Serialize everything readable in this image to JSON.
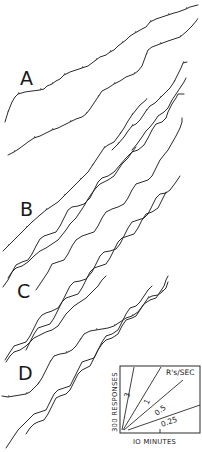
{
  "figure": {
    "panels": [
      {
        "label": "A",
        "x": 20,
        "y": 85
      },
      {
        "label": "B",
        "x": 20,
        "y": 216
      },
      {
        "label": "C",
        "x": 17,
        "y": 298
      },
      {
        "label": "D",
        "x": 18,
        "y": 380
      }
    ],
    "records": [
      {
        "name": "record-A1",
        "points": "5,122 8,112 12,102 15,97 18,94 25,92 32,91 40,90 44,89 47,86 52,84 56,81 60,79 64,75 70,72 76,70 82,68 88,66 92,63 96,60 100,57 106,55 110,52 114,50 118,46 122,43 126,40 130,36 135,33 142,29 146,27 150,22 156,19 162,17 168,15 174,13 178,12 186,9 190,7 198,5"
      },
      {
        "name": "record-A2",
        "points": "8,155 14,152 20,148 28,142 34,138 40,136 46,133 52,130 58,128 64,125 70,122 76,119 82,117 86,114 90,109 94,103 98,97 102,91 108,88 114,84 120,81 126,77 134,74 138,71 142,66 146,55 148,50 152,47 160,44 168,41 174,39 180,37 186,32 192,26 197,20"
      },
      {
        "name": "record-A3",
        "points": "112,150 118,144 124,137 128,131 132,126 136,124 140,120 146,111 150,106 155,103 160,98 165,93 170,88 174,82 178,74 181,68 183,63 187,62"
      },
      {
        "name": "record-A4",
        "points": "132,150 137,144 142,137 146,131 150,127 154,122 158,116 164,112 168,108 172,100 176,94 180,88 184,82 186,78"
      },
      {
        "name": "record-B1",
        "points": "3,251 8,246 14,240 20,234 26,228 32,222 40,215 46,210 52,206 58,202 64,196 70,190 74,186 80,180 84,176 88,172 92,166 96,160 100,154 104,148 108,145 114,142 120,134 124,128 128,121 132,115 136,110 140,105 146,100"
      },
      {
        "name": "record-B2",
        "points": "8,278 12,272 16,268 22,266 28,262 34,256 40,251 46,248 52,244 58,240 62,235 66,230 70,224 76,218 80,212 84,206 88,199 92,193 96,188 100,184 108,180 114,176 118,170 122,164 128,158 132,152 136,147"
      },
      {
        "name": "record-C1",
        "points": "3,287 8,280 12,272 16,265 22,262 28,260 32,254 36,246 40,239 44,236 50,234 56,232 60,226 64,218 68,210 72,207 78,206 84,204 90,198 94,190 98,182 102,178 108,176 114,172 120,165 126,158 132,152 138,150 144,145 148,138 152,130 156,124 162,122 166,118 168,112 172,104 176,98 178,94 184,94"
      },
      {
        "name": "record-C2",
        "points": "36,290 40,284 44,278 48,272 52,264 58,262 64,260 68,254 72,246 76,240 82,236 88,234 94,232 98,226 102,218 106,212 112,209 118,207 124,204 128,198 132,190 136,184 142,182 148,180 152,176 156,168 160,160 164,155 168,150 172,143 176,136 180,128 182,122 182,118"
      },
      {
        "name": "record-C3",
        "points": "5,360 10,352 14,346 20,344 26,342 30,336 34,328 38,320 42,315 46,313 52,311 58,308 62,302 66,294 70,286 74,282 80,281 86,279 92,272 96,264 100,256 104,252 110,251 116,249 120,244 124,236 128,228 132,222 138,220 144,218 148,214 152,206 156,198 160,194 166,193 170,190 176,182 180,176"
      },
      {
        "name": "record-C4",
        "points": "26,350 30,342 34,334 38,328 44,326 50,324 54,318 58,310 62,302 66,298 72,296 78,294 82,288 86,280 90,272 94,268 100,266 106,264 110,258 114,250 118,242 122,238 128,236 134,234 138,228 142,220 146,214 152,212 158,208 162,200 166,192"
      },
      {
        "name": "record-D1",
        "points": "2,396 8,397 14,396 20,395 26,394 30,392 34,388 38,384 42,378 46,370 50,362 54,356 60,354 66,353 72,350 76,346 80,340 84,334 90,331 96,330 102,329 108,328 114,326 120,322 126,318 132,316 138,312 144,304 148,298 152,296 158,295 162,292 166,288 168,282"
      },
      {
        "name": "record-D2",
        "points": "6,362 10,356 14,352 20,350 26,346 30,342 34,338 40,335 46,332 52,330 58,326 62,320 66,314 70,310 74,306 80,302 86,298 90,294 94,290 98,286 102,280 106,276"
      },
      {
        "name": "record-D3",
        "points": "26,434 30,428 34,424 38,422 44,420 48,414 52,406 56,398 60,396 66,394 70,390 74,382 78,374 82,370 86,368 90,366 94,358 98,350 102,344 106,340 112,338 118,334 122,326 126,320 132,318 136,316 140,310 144,304 150,300 156,298 160,292 164,286 166,280 168,276"
      },
      {
        "name": "record-D4",
        "points": "6,448 10,442 14,436 18,430 22,426 26,422 30,418 34,414 40,412 46,410 50,402 54,394 58,390 64,388 70,386 74,378 78,370 82,362 88,360 94,358 98,350 102,342 106,336 112,334 118,330 122,322 126,314 130,308 136,306 140,302 144,296 148,290 152,286"
      }
    ],
    "key": {
      "box": {
        "x": 120,
        "y": 366,
        "w": 80,
        "h": 67
      },
      "rates": [
        {
          "label": "3",
          "x": 130,
          "y": 395,
          "rotate": -75
        },
        {
          "label": "1",
          "x": 150,
          "y": 402,
          "rotate": -62
        },
        {
          "label": "0.5",
          "x": 159,
          "y": 413,
          "rotate": -38
        },
        {
          "label": "0.25",
          "x": 163,
          "y": 425,
          "rotate": -22
        }
      ],
      "rate_unit": "R's/SEC",
      "y_axis_label": "300 RESPONSES",
      "x_axis_label": "IO MINUTES"
    }
  }
}
